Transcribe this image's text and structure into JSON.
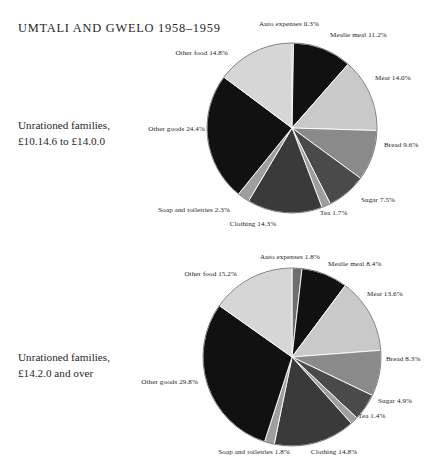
{
  "figure": {
    "title": "UMTALI AND GWELO 1958–1959"
  },
  "charts": [
    {
      "caption_line1": "Unrationed families,",
      "caption_line2": "£10.14.6 to £14.0.0",
      "labels": {
        "auto": "Auto expenses 0.3%",
        "mealie": "Mealie meal 11.2%",
        "meat": "Meat 14.0%",
        "bread": "Bread 9.6%",
        "sugar": "Sugar 7.5%",
        "tea": "Tea 1.7%",
        "clothing": "Clothing 14.3%",
        "soap": "Soap and toiletries 2.3%",
        "other_goods": "Other goods 24.4%",
        "other_food": "Other food 14.8%"
      }
    },
    {
      "caption_line1": "Unrationed families,",
      "caption_line2": "£14.2.0 and over",
      "labels": {
        "auto": "Auto expenses 1.8%",
        "mealie": "Mealie meal 8.4%",
        "meat": "Meat 13.6%",
        "bread": "Bread 8.3%",
        "sugar": "Sugar 4.9%",
        "tea": "Tea 1.4%",
        "clothing": "Clothing 14.8%",
        "soap": "Soap and toiletries 1.8%",
        "other_goods": "Other goods 29.8%",
        "other_food": "Other food 15.2%"
      }
    }
  ],
  "chart_data": [
    {
      "type": "pie",
      "title": "Unrationed families, £10.14.6 to £14.0.0",
      "legend_position": "outside-callout-labels",
      "start_angle_deg": -90,
      "direction": "clockwise",
      "categories": [
        "Auto expenses",
        "Mealie meal",
        "Meat",
        "Bread",
        "Sugar",
        "Tea",
        "Clothing",
        "Soap and toiletries",
        "Other goods",
        "Other food"
      ],
      "values": [
        0.3,
        11.2,
        14.0,
        9.6,
        7.5,
        1.7,
        14.3,
        2.3,
        24.4,
        14.8
      ],
      "unit": "%",
      "colors": [
        "#6e6e6e",
        "#111111",
        "#c9c9c9",
        "#8a8a8a",
        "#4a4a4a",
        "#9e9e9e",
        "#3a3a3a",
        "#9e9e9e",
        "#111111",
        "#d6d6d6"
      ]
    },
    {
      "type": "pie",
      "title": "Unrationed families, £14.2.0 and over",
      "legend_position": "outside-callout-labels",
      "start_angle_deg": -90,
      "direction": "clockwise",
      "categories": [
        "Auto expenses",
        "Mealie meal",
        "Meat",
        "Bread",
        "Sugar",
        "Tea",
        "Clothing",
        "Soap and toiletries",
        "Other goods",
        "Other food"
      ],
      "values": [
        1.8,
        8.4,
        13.6,
        8.3,
        4.9,
        1.4,
        14.8,
        1.8,
        29.8,
        15.2
      ],
      "unit": "%",
      "colors": [
        "#6e6e6e",
        "#111111",
        "#c9c9c9",
        "#8a8a8a",
        "#4a4a4a",
        "#9e9e9e",
        "#3a3a3a",
        "#9e9e9e",
        "#111111",
        "#d6d6d6"
      ]
    }
  ]
}
